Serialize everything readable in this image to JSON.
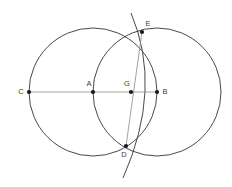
{
  "figure": {
    "background_color": "#ffffff",
    "width": 232,
    "height": 187,
    "stroke_color": "#333333",
    "thin_stroke_color": "#777777",
    "point_color": "#1a1a1a",
    "label_color": "#3a3a3a",
    "points": [
      {
        "id": "C",
        "label": "C",
        "x": 29,
        "y": 92,
        "label_x": 21,
        "label_y": 94,
        "dot": true
      },
      {
        "id": "A",
        "label": "A",
        "x": 93,
        "y": 92,
        "label_x": 86,
        "label_y": 86,
        "dot": true
      },
      {
        "id": "G",
        "label": "G",
        "x": 131,
        "y": 92,
        "label_x": 124,
        "label_y": 86,
        "dot": true
      },
      {
        "id": "B",
        "label": "B",
        "x": 157,
        "y": 92,
        "label_x": 163,
        "label_y": 94,
        "dot": true
      },
      {
        "id": "E",
        "label": "E",
        "x": 142,
        "y": 32,
        "label_x": 146,
        "label_y": 26,
        "dot": true
      },
      {
        "id": "D",
        "label": "D",
        "x": 126,
        "y": 146,
        "label_x": 123,
        "label_y": 156,
        "dot": true
      }
    ],
    "circles": [
      {
        "id": "circle-A",
        "center": "A",
        "cx": 93,
        "cy": 92,
        "r": 64
      },
      {
        "id": "circle-B",
        "center": "B",
        "cx": 157,
        "cy": 92,
        "r": 64
      }
    ],
    "arcs": [
      {
        "id": "arc-ED",
        "through": [
          "E",
          "D"
        ],
        "path": "M 131 13 Q 163 88 123 178"
      }
    ],
    "segments": [
      {
        "id": "segment-CB",
        "from": "C",
        "to": "B",
        "x1": 29,
        "y1": 92,
        "x2": 158,
        "y2": 92
      },
      {
        "id": "segment-ED",
        "from": "E",
        "to": "D",
        "x1": 142,
        "y1": 32,
        "x2": 126,
        "y2": 146
      }
    ]
  }
}
